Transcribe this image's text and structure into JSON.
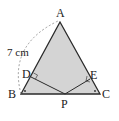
{
  "diagram": {
    "points": {
      "A": {
        "label": "A",
        "x": 60,
        "y": 22
      },
      "B": {
        "label": "B",
        "x": 21,
        "y": 94
      },
      "C": {
        "label": "C",
        "x": 100,
        "y": 94
      },
      "D": {
        "label": "D",
        "x": 31,
        "y": 77
      },
      "E": {
        "label": "E",
        "x": 90,
        "y": 79
      },
      "P": {
        "label": "P",
        "x": 65,
        "y": 94
      }
    },
    "measurement": {
      "label": "7 cm",
      "segment": "AB"
    },
    "colors": {
      "fill": "#d4d4d4",
      "stroke": "#2a2a2a",
      "dash": "#888888"
    }
  }
}
